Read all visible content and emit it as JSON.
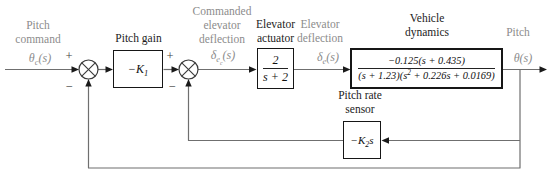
{
  "figure": {
    "type": "feedback-control-block-diagram"
  },
  "signals": {
    "pitch_command": {
      "name_lines": [
        "Pitch",
        "command"
      ],
      "sym_base": "θ",
      "sym_sub": "c",
      "sym_post": "(s)"
    },
    "commanded_elevator_deflection": {
      "name_lines": [
        "Commanded",
        "elevator",
        "deflection"
      ],
      "sym_base": "δ",
      "sym_sub": "e",
      "sym_subsub": "c",
      "sym_post": "(s)"
    },
    "elevator_deflection": {
      "name_lines": [
        "Elevator",
        "deflection"
      ],
      "sym_base": "δ",
      "sym_sub": "e",
      "sym_post": "(s)"
    },
    "pitch": {
      "name": "Pitch",
      "sym_base": "θ",
      "sym_post": "(s)"
    }
  },
  "blocks": {
    "pitch_gain": {
      "title": "Pitch gain",
      "gain_base": "−K",
      "gain_sub": "1"
    },
    "elevator_actuator": {
      "title_lines": [
        "Elevator",
        "actuator"
      ],
      "numerator": "2",
      "denominator": "s + 2"
    },
    "vehicle_dynamics": {
      "title_lines": [
        "Vehicle",
        "dynamics"
      ],
      "numerator": "−0.125(s + 0.435)",
      "denominator_pre": "(s + 1.23)(s",
      "denominator_sup": "2",
      "denominator_post": " + 0.226s + 0.0169)"
    },
    "pitch_rate_sensor": {
      "title_lines": [
        "Pitch rate",
        "sensor"
      ],
      "gain_base": "−K",
      "gain_sub": "2",
      "gain_post": "s"
    }
  },
  "summing_junctions": {
    "sum1": {
      "top_sign": "+",
      "bottom_sign": "−"
    },
    "sum2": {
      "top_sign": "+",
      "bottom_sign": "−"
    }
  },
  "colors": {
    "signal_label": "#8c8c8c",
    "block_label": "#1c1c1c",
    "line": "#6f6f6f",
    "arrow": "#1a1a1a",
    "background": "#ffffff"
  }
}
